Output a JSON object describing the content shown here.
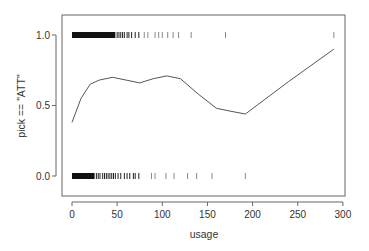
{
  "chart_data": {
    "type": "line",
    "title": "",
    "xlabel": "usage",
    "ylabel": "pick == \"ATT\"",
    "xlim": [
      0,
      300
    ],
    "ylim": [
      -0.15,
      1.15
    ],
    "grid": false,
    "x_ticks": [
      0,
      50,
      100,
      150,
      200,
      250,
      300
    ],
    "x_tick_labels": [
      "0",
      "50",
      "100",
      "150",
      "200",
      "250",
      "300"
    ],
    "y_ticks": [
      0.0,
      0.5,
      1.0
    ],
    "y_tick_labels": [
      "0.0",
      "0.5",
      "1.0"
    ],
    "series": [
      {
        "name": "smoothed fit",
        "kind": "line",
        "x": [
          0,
          10,
          20,
          30,
          45,
          60,
          75,
          90,
          105,
          120,
          140,
          160,
          175,
          192,
          240,
          290
        ],
        "y": [
          0.38,
          0.55,
          0.65,
          0.68,
          0.7,
          0.68,
          0.66,
          0.69,
          0.71,
          0.69,
          0.58,
          0.48,
          0.46,
          0.44,
          0.67,
          0.9
        ]
      },
      {
        "name": "rug pick == ATT (1)",
        "kind": "rug",
        "y_level": 1.0,
        "x_dense_range": [
          0,
          48
        ],
        "x": [
          50,
          52,
          54,
          56,
          58,
          61,
          63,
          66,
          70,
          74,
          80,
          84,
          92,
          96,
          100,
          106,
          112,
          118,
          132,
          170,
          290
        ]
      },
      {
        "name": "rug pick == ATT (0)",
        "kind": "rug",
        "y_level": 0.0,
        "x_dense_range": [
          0,
          25
        ],
        "x": [
          27,
          29,
          31,
          34,
          36,
          38,
          40,
          42,
          44,
          46,
          48,
          51,
          54,
          58,
          61,
          64,
          68,
          70,
          74,
          88,
          92,
          104,
          113,
          128,
          138,
          155,
          192
        ]
      }
    ],
    "colors": {
      "line": "#555555",
      "rug": "#111111",
      "axis": "#555555"
    }
  }
}
